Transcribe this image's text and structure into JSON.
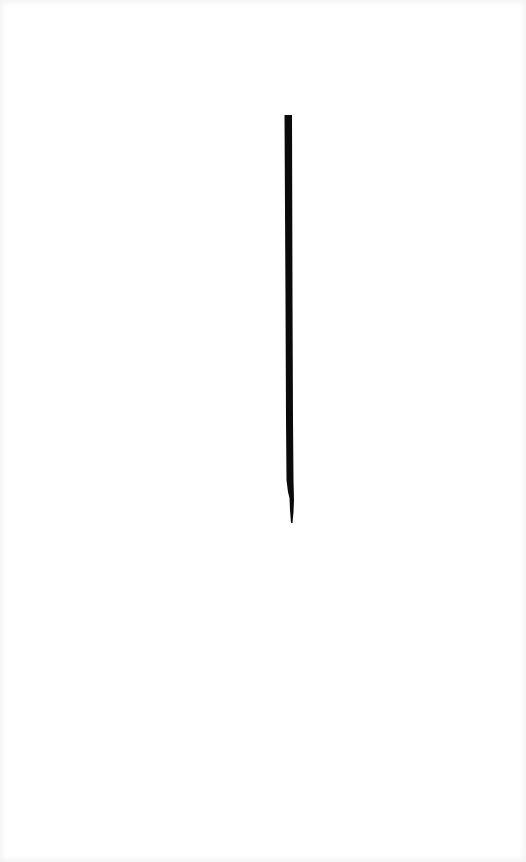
{
  "image": {
    "background_color": "#ffffff",
    "description": "single vertical black line",
    "stroke": {
      "color": "#0a0a0a",
      "top": {
        "x": 288,
        "y": 115
      },
      "bottom": {
        "x": 291,
        "y": 523
      },
      "width": 7
    }
  }
}
